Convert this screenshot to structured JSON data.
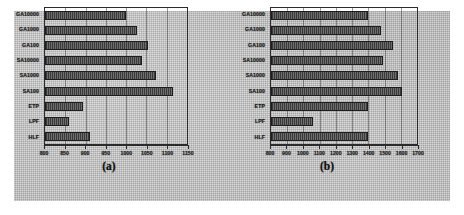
{
  "figure": {
    "background_color": "#bfbfbf",
    "bar_color": "#4a4a4a",
    "axis_color": "#2b2b2b"
  },
  "chart_data": [
    {
      "type": "bar",
      "orientation": "horizontal",
      "panel_label": "(a)",
      "title": "",
      "xlabel": "",
      "ylabel": "",
      "categories": [
        "GA10000",
        "GA1000",
        "GA100",
        "SA10000",
        "SA1000",
        "SA100",
        "ETP",
        "LPF",
        "HLF"
      ],
      "values": [
        1000,
        1027,
        1055,
        1040,
        1073,
        1115,
        893,
        858,
        912
      ],
      "xlim": [
        800,
        1150
      ],
      "xticks": [
        800,
        850,
        900,
        950,
        1000,
        1050,
        1100,
        1150
      ],
      "xtick_labels": [
        "800",
        "850",
        "900",
        "950",
        "1000",
        "1050",
        "1100",
        "1150"
      ],
      "grid": true,
      "legend": null
    },
    {
      "type": "bar",
      "orientation": "horizontal",
      "panel_label": "(b)",
      "title": "",
      "xlabel": "",
      "ylabel": "",
      "categories": [
        "GA10000",
        "GA1000",
        "GA100",
        "SA10000",
        "SA1000",
        "SA100",
        "ETP",
        "LPF",
        "HLF"
      ],
      "values": [
        1400,
        1480,
        1550,
        1490,
        1580,
        1610,
        1400,
        1060,
        1400
      ],
      "xlim": [
        800,
        1700
      ],
      "xticks": [
        800,
        900,
        1000,
        1100,
        1200,
        1300,
        1400,
        1500,
        1600,
        1700
      ],
      "xtick_labels": [
        "800",
        "900",
        "1000",
        "1100",
        "1200",
        "1300",
        "1400",
        "1500",
        "1600",
        "1700"
      ],
      "grid": true,
      "legend": null
    }
  ]
}
